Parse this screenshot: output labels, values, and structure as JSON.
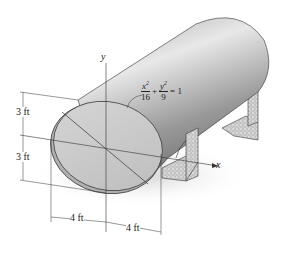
{
  "figure": {
    "type": "engineering-diagram",
    "axes": {
      "x_label": "x",
      "y_label": "y"
    },
    "equation": {
      "term1": {
        "numerator": "x",
        "exponent": "2",
        "denominator": "16"
      },
      "plus": "+",
      "term2": {
        "numerator": "y",
        "exponent": "2",
        "denominator": "9"
      },
      "equals": "= 1"
    },
    "dimensions": {
      "upper_vertical": "3 ft",
      "lower_vertical": "3 ft",
      "left_horizontal": "4 ft",
      "right_horizontal": "4 ft"
    },
    "colors": {
      "tank_light": "#d9d9d9",
      "tank_dark": "#8c8c8c",
      "face_fill": "#c8c8c8",
      "support_fill": "#cfcfcf",
      "line": "#222222"
    }
  }
}
